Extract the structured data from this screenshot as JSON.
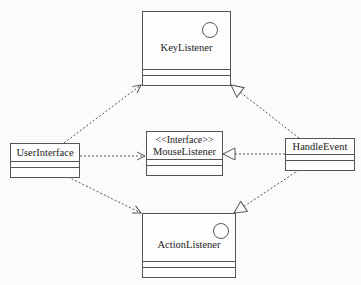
{
  "diagram": {
    "type": "uml-class-diagram",
    "classes": {
      "key_listener": {
        "name": "KeyListener",
        "has_interface_circle": true
      },
      "user_interface": {
        "name": "UserInterface"
      },
      "mouse_listener": {
        "stereotype": "<<Interface>>",
        "name": "MouseListener"
      },
      "handle_event": {
        "name": "HandleEvent"
      },
      "action_listener": {
        "name": "ActionListener",
        "has_interface_circle": true
      }
    },
    "relations": [
      {
        "from": "UserInterface",
        "to": "KeyListener",
        "kind": "dependency",
        "line": "dashed",
        "head": "open-arrow"
      },
      {
        "from": "UserInterface",
        "to": "MouseListener",
        "kind": "dependency",
        "line": "dashed",
        "head": "open-arrow"
      },
      {
        "from": "UserInterface",
        "to": "ActionListener",
        "kind": "dependency",
        "line": "dashed",
        "head": "open-arrow"
      },
      {
        "from": "HandleEvent",
        "to": "KeyListener",
        "kind": "realization",
        "line": "dashed",
        "head": "hollow-triangle"
      },
      {
        "from": "HandleEvent",
        "to": "MouseListener",
        "kind": "realization",
        "line": "dashed",
        "head": "hollow-triangle"
      },
      {
        "from": "HandleEvent",
        "to": "ActionListener",
        "kind": "realization",
        "line": "dashed",
        "head": "hollow-triangle"
      }
    ],
    "colors": {
      "line": "#555555",
      "text": "#1a1a1a",
      "background": "#fbfbfa"
    }
  }
}
